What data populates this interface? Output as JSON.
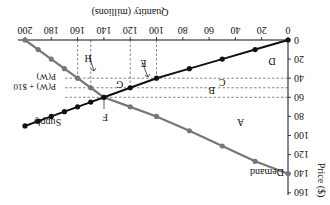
{
  "chart_data": {
    "type": "line",
    "rotation_degrees": 180,
    "title": "",
    "xlabel": "Quantity (millions)",
    "ylabel": "Price ($)",
    "xlim": [
      0,
      200
    ],
    "ylim": [
      0,
      160
    ],
    "x_ticks": [
      0,
      20,
      40,
      60,
      80,
      100,
      120,
      140,
      160,
      180,
      200
    ],
    "y_ticks": [
      0,
      20,
      40,
      60,
      80,
      100,
      120,
      140,
      160
    ],
    "grid": false,
    "series": [
      {
        "name": "Demand",
        "color": "#777777",
        "points": [
          [
            0,
            140
          ],
          [
            25,
            127
          ],
          [
            50,
            111
          ],
          [
            75,
            95
          ],
          [
            100,
            80
          ],
          [
            120,
            70
          ],
          [
            140,
            60
          ],
          [
            150,
            50
          ],
          [
            160,
            40
          ],
          [
            170,
            30
          ],
          [
            180,
            20
          ],
          [
            190,
            10
          ],
          [
            200,
            0
          ]
        ]
      },
      {
        "name": "Supply",
        "color": "#111111",
        "points": [
          [
            0,
            0
          ],
          [
            25,
            10
          ],
          [
            50,
            20
          ],
          [
            75,
            30
          ],
          [
            100,
            40
          ],
          [
            120,
            50
          ],
          [
            140,
            60
          ],
          [
            150,
            65
          ],
          [
            160,
            70
          ],
          [
            170,
            75
          ],
          [
            180,
            80
          ],
          [
            190,
            85
          ],
          [
            200,
            90
          ]
        ]
      }
    ],
    "reference_lines": {
      "horizontal": [
        {
          "label": "P(W)",
          "y": 40
        },
        {
          "label": "P(W) + $10",
          "y": 50
        },
        {
          "label": "",
          "y": 60
        }
      ],
      "vertical": [
        100,
        120,
        150,
        160
      ]
    },
    "region_labels": [
      {
        "label": "A",
        "x": 36,
        "y": 86
      },
      {
        "label": "B",
        "x": 58,
        "y": 53
      },
      {
        "label": "C",
        "x": 50,
        "y": 45
      },
      {
        "label": "D",
        "x": 12,
        "y": 23
      },
      {
        "label": "E",
        "x": 110,
        "y": 25
      },
      {
        "label": "F",
        "x": 139,
        "y": 81
      },
      {
        "label": "G",
        "x": 128,
        "y": 47
      },
      {
        "label": "H",
        "x": 152,
        "y": 19
      }
    ],
    "equilibrium": {
      "label": "F",
      "quantity": 140,
      "price": 60
    }
  },
  "labels": {
    "x_axis_title": "Quantity (millions)",
    "y_axis_title": "Price ($)",
    "demand": "Demand",
    "supply": "Supply",
    "pw": "P(W)",
    "pw10": "P(W) + $10",
    "A": "A",
    "B": "B",
    "C": "C",
    "D": "D",
    "E": "E",
    "F": "F",
    "G": "G",
    "H": "H"
  },
  "ticks": {
    "x": [
      "0",
      "20",
      "40",
      "60",
      "80",
      "100",
      "120",
      "140",
      "160",
      "180",
      "200"
    ],
    "y": [
      "0",
      "20",
      "40",
      "60",
      "80",
      "100",
      "120",
      "140",
      "160"
    ]
  }
}
